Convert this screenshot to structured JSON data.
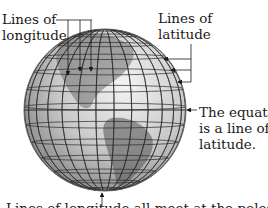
{
  "diagram": {
    "labels": {
      "longitude": [
        "Lines of",
        "longitude"
      ],
      "latitude": [
        "Lines of",
        "latitude"
      ],
      "equator": [
        "The equator",
        "is a line of",
        "latitude."
      ],
      "bottom_caption_truncated": "Lines of longitude all meet at the poles."
    },
    "globe": {
      "latitude_line_count": 14,
      "longitude_line_count": 14,
      "shade_color": "#9a9a9a",
      "grid_color": "#2b2b2b",
      "land_color": "#6e6e6e"
    },
    "arrows": {
      "longitude_pointer_count": 3,
      "latitude_pointer_count": 3,
      "equator_pointer_count": 1,
      "pole_pointer_count": 1
    }
  }
}
